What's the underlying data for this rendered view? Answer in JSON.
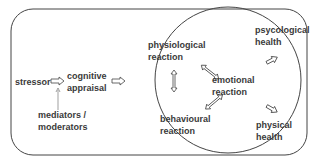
{
  "nodes": {
    "stressor": "stressor",
    "cognitive_appraisal": [
      "cognitive",
      "appraisal"
    ],
    "mediators": [
      "mediators /",
      "moderators"
    ],
    "physiological": [
      "physiological",
      "reaction"
    ],
    "emotional": [
      "emotional",
      "reaction"
    ],
    "behavioural": [
      "behavioural",
      "reaction"
    ],
    "psychological_health": [
      "psycological",
      "health"
    ],
    "physical_health": [
      "physical",
      "health"
    ]
  },
  "colors": {
    "stroke": "#444444",
    "text": "#3a3a3a"
  }
}
